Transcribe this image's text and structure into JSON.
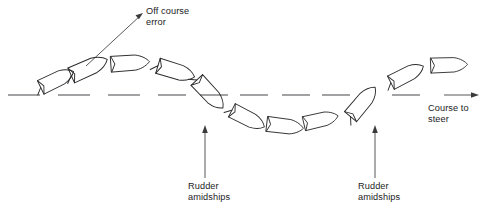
{
  "diagram": {
    "background_color": "#ffffff",
    "line_color": "#2b2b2b",
    "dash_color": "#56565a",
    "width": 487,
    "height": 215
  },
  "labels": {
    "off_course_error": {
      "line1": "Off course",
      "line2": "error"
    },
    "rudder_amidships_1": {
      "line1": "Rudder",
      "line2": "amidships"
    },
    "rudder_amidships_2": {
      "line1": "Rudder",
      "line2": "amidships"
    },
    "course_to_steer": {
      "line1": "Course to",
      "line2": "steer"
    }
  },
  "chart_data": {
    "type": "line",
    "xlabel": "",
    "ylabel": "",
    "grid": false,
    "legend": null,
    "baseline_y": 95,
    "annotations": [
      {
        "name": "off-course-error",
        "text": "Off course error",
        "x": 146,
        "y": 6,
        "leader_from": [
          86,
          66
        ],
        "leader_to": [
          143,
          14
        ]
      },
      {
        "name": "rudder-amidships-left",
        "text": "Rudder amidships",
        "x": 188,
        "y": 181,
        "arrow_from": [
          205,
          178
        ],
        "arrow_to": [
          205,
          127
        ]
      },
      {
        "name": "rudder-amidships-right",
        "text": "Rudder amidships",
        "x": 358,
        "y": 181,
        "arrow_from": [
          375,
          178
        ],
        "arrow_to": [
          375,
          127
        ]
      },
      {
        "name": "course-to-steer",
        "text": "Course to steer",
        "x": 428,
        "y": 103,
        "arrow_from": [
          444,
          95
        ],
        "arrow_to": [
          478,
          95
        ]
      }
    ],
    "course_line_dashes": [
      [
        8,
        40
      ],
      [
        58,
        90
      ],
      [
        108,
        140
      ],
      [
        158,
        186
      ],
      [
        200,
        228
      ],
      [
        240,
        268
      ],
      [
        282,
        310
      ],
      [
        322,
        350
      ],
      [
        392,
        420
      ]
    ],
    "vessels": [
      {
        "index": 1,
        "x": 56,
        "y": 80,
        "heading_deg": -26,
        "scale": 1.0,
        "position": "on-course-rising"
      },
      {
        "index": 2,
        "x": 88,
        "y": 68,
        "heading_deg": -24,
        "scale": 1.08,
        "position": "above-line"
      },
      {
        "index": 3,
        "x": 129,
        "y": 63,
        "heading_deg": -4,
        "scale": 1.05,
        "position": "above-line-peak"
      },
      {
        "index": 4,
        "x": 175,
        "y": 71,
        "heading_deg": 17,
        "scale": 1.05,
        "position": "above-line-falling"
      },
      {
        "index": 5,
        "x": 209,
        "y": 93,
        "heading_deg": 47,
        "scale": 1.05,
        "position": "crossing-line-down"
      },
      {
        "index": 6,
        "x": 247,
        "y": 118,
        "heading_deg": 27,
        "scale": 1.0,
        "position": "below-line"
      },
      {
        "index": 7,
        "x": 284,
        "y": 126,
        "heading_deg": 7,
        "scale": 1.0,
        "position": "below-line-trough"
      },
      {
        "index": 8,
        "x": 320,
        "y": 120,
        "heading_deg": -13,
        "scale": 0.95,
        "position": "below-line-rising"
      },
      {
        "index": 9,
        "x": 362,
        "y": 103,
        "heading_deg": -50,
        "scale": 1.05,
        "position": "crossing-line-up"
      },
      {
        "index": 10,
        "x": 406,
        "y": 75,
        "heading_deg": -27,
        "scale": 1.0,
        "position": "above-line"
      },
      {
        "index": 11,
        "x": 448,
        "y": 65,
        "heading_deg": -2,
        "scale": 1.0,
        "position": "above-line-settling"
      }
    ]
  }
}
